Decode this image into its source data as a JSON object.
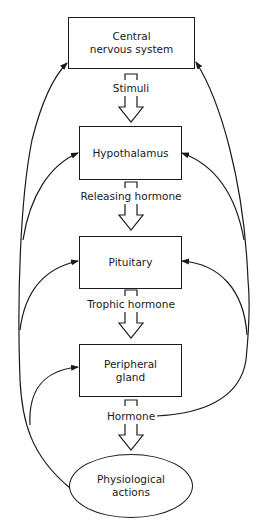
{
  "diagram": {
    "nodes": {
      "cns": {
        "line1": "Central",
        "line2": "nervous system"
      },
      "hypothalamus": {
        "label": "Hypothalamus"
      },
      "pituitary": {
        "label": "Pituitary"
      },
      "peripheral": {
        "line1": "Peripheral",
        "line2": "gland"
      },
      "physiological": {
        "line1": "Physiological",
        "line2": "actions"
      }
    },
    "edges": {
      "stimuli": "Stimuli",
      "releasing": "Releasing hormone",
      "trophic": "Trophic hormone",
      "hormone": "Hormone"
    },
    "colors": {
      "line": "#1a1a1a",
      "background": "#ffffff"
    }
  }
}
